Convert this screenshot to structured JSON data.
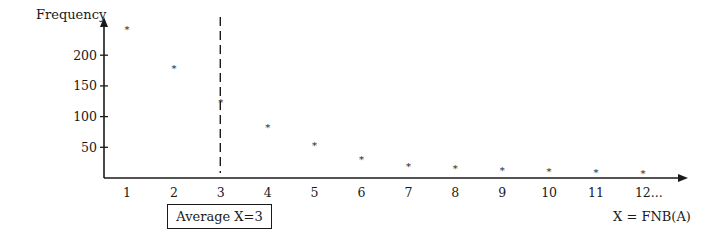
{
  "chart_data": {
    "type": "scatter",
    "title": "",
    "xlabel": "X = FNB(A)",
    "ylabel": "Frequency",
    "x": [
      1,
      2,
      3,
      4,
      5,
      6,
      7,
      8,
      9,
      10,
      11,
      12
    ],
    "x_tick_labels": [
      "1",
      "2",
      "3",
      "4",
      "5",
      "6",
      "7",
      "8",
      "9",
      "10",
      "11",
      "12..."
    ],
    "y_ticks": [
      50,
      100,
      150,
      200
    ],
    "y_tick_labels": [
      "50",
      "100",
      "150",
      "200"
    ],
    "series": [
      {
        "name": "Frequency",
        "marker": "*",
        "values": [
          245,
          180,
          125,
          85,
          55,
          33,
          21,
          18,
          15,
          13,
          11,
          10
        ]
      }
    ],
    "ylim": [
      0,
      250
    ],
    "xlim": [
      0.5,
      13.5
    ],
    "grid": false,
    "legend": "none",
    "annotations": [
      {
        "type": "vertical-dashed-line",
        "x": 3,
        "label": "Average X=3"
      }
    ]
  },
  "labels": {
    "ylabel": "Frequency",
    "xlabel": "X = FNB(A)",
    "average": "Average X=3"
  }
}
